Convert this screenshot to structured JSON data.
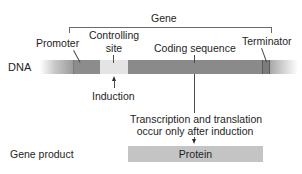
{
  "diagram": {
    "gene_label": "Gene",
    "row_labels": {
      "dna": "DNA",
      "gene_product": "Gene product"
    },
    "regions": [
      {
        "id": "promoter",
        "label": "Promoter",
        "color": "#8c8c8c"
      },
      {
        "id": "controlling_site",
        "label_line1": "Controlling",
        "label_line2": "site",
        "color": "#e4e4e4"
      },
      {
        "id": "coding_sequence",
        "label": "Coding sequence",
        "color": "#8a8a8a"
      },
      {
        "id": "terminator",
        "label": "Terminator",
        "color": "#7c7c7c"
      }
    ],
    "induction_label": "Induction",
    "process_text": {
      "line1": "Transcription and translation",
      "line2": "occur only after induction"
    },
    "product": {
      "label": "Protein",
      "color": "#c4c4c4"
    }
  }
}
